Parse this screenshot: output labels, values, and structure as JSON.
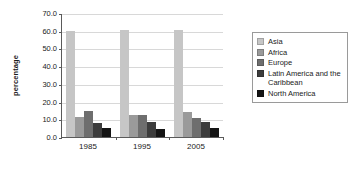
{
  "chart_data": {
    "type": "bar",
    "title": "",
    "xlabel": "",
    "ylabel": "percentage",
    "categories": [
      "1985",
      "1995",
      "2005"
    ],
    "ylim": [
      0.0,
      70.0
    ],
    "ytick_labels": [
      "0.0",
      "10.0",
      "20.0",
      "30.0",
      "40.0",
      "50.0",
      "60.0",
      "70.0"
    ],
    "yticks": [
      0.0,
      10.0,
      20.0,
      30.0,
      40.0,
      50.0,
      60.0,
      70.0
    ],
    "grid": true,
    "legend_position": "right",
    "series": [
      {
        "name": "Asia",
        "color": "#c6c6c6",
        "values": [
          59.6,
          60.4,
          60.4
        ]
      },
      {
        "name": "Africa",
        "color": "#9a9a9a",
        "values": [
          11.2,
          12.3,
          14.0
        ]
      },
      {
        "name": "Europe",
        "color": "#6e6e6e",
        "values": [
          14.5,
          12.5,
          11.0
        ]
      },
      {
        "name": "Latin America and the Caribbean",
        "color": "#3c3c3c",
        "values": [
          8.1,
          8.3,
          8.4
        ]
      },
      {
        "name": "North America",
        "color": "#141414",
        "values": [
          5.0,
          4.8,
          5.0
        ]
      }
    ]
  },
  "legend": {
    "items": [
      {
        "label": "Asia",
        "color": "#c6c6c6"
      },
      {
        "label": "Africa",
        "color": "#9a9a9a"
      },
      {
        "label": "Europe",
        "color": "#6e6e6e"
      },
      {
        "label": "Latin America and the Caribbean",
        "color": "#3c3c3c"
      },
      {
        "label": "North America",
        "color": "#141414"
      }
    ]
  },
  "axis": {
    "line_color": "#5a5a5a",
    "grid_color": "#d8d8d8"
  }
}
